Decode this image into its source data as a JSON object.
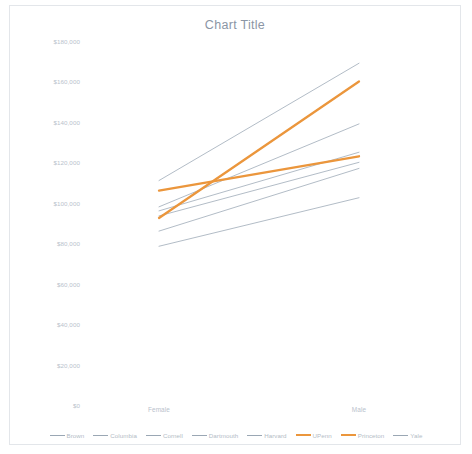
{
  "chart": {
    "title": "Chart Title",
    "background": "#ffffff",
    "border_color": "#e3e6ea"
  },
  "chart_data": {
    "type": "line",
    "title": "Chart Title",
    "xlabel": "",
    "ylabel": "",
    "categories": [
      "Female",
      "Male"
    ],
    "x_tick_labels": [
      "Female",
      "Male"
    ],
    "y_tick_labels": [
      "$180,000",
      "$160,000",
      "$140,000",
      "$120,000",
      "$100,000",
      "$80,000",
      "$60,000",
      "$40,000",
      "$20,000",
      "$0"
    ],
    "y_tick_values": [
      180000,
      160000,
      140000,
      120000,
      100000,
      80000,
      60000,
      40000,
      20000,
      0
    ],
    "ylim": [
      0,
      180000
    ],
    "grid": false,
    "legend_position": "bottom",
    "series": [
      {
        "name": "Brown",
        "values": [
          111000,
          169000
        ],
        "color": "#9aa7b4",
        "highlight": false
      },
      {
        "name": "Columbia",
        "values": [
          98000,
          139000
        ],
        "color": "#9aa7b4",
        "highlight": false
      },
      {
        "name": "Cornell",
        "values": [
          96000,
          125000
        ],
        "color": "#9aa7b4",
        "highlight": false
      },
      {
        "name": "Dartmouth",
        "values": [
          86000,
          117000
        ],
        "color": "#9aa7b4",
        "highlight": false
      },
      {
        "name": "Harvard",
        "values": [
          93500,
          120000
        ],
        "color": "#9aa7b4",
        "highlight": false
      },
      {
        "name": "UPenn",
        "values": [
          106000,
          123000
        ],
        "color": "#eb963c",
        "highlight": true
      },
      {
        "name": "Princeton",
        "values": [
          92500,
          160000
        ],
        "color": "#eb963c",
        "highlight": true
      },
      {
        "name": "Yale",
        "values": [
          78500,
          102500
        ],
        "color": "#9aa7b4",
        "highlight": false
      }
    ]
  }
}
